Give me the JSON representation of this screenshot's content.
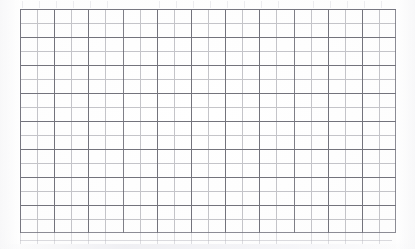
{
  "document": {
    "kind": "graph-paper-grid",
    "description": "Scanned sheet of blank quadrille graph paper",
    "caption": "",
    "has_text": false,
    "has_labels": false
  },
  "canvas": {
    "width": 415,
    "height": 249,
    "background_color": "#ffffff",
    "paper_tone_color": "#fdfdfd"
  },
  "grid": {
    "origin_x": 20,
    "origin_y": 9,
    "width": 376,
    "height": 224,
    "columns": 22,
    "rows": 16,
    "cell_width": 17.1,
    "cell_height": 14.0,
    "major_every_columns": 2,
    "major_every_rows": 2,
    "minor_line_color": "#96969e",
    "major_line_color": "#60606a",
    "border_line_color": "#787882",
    "minor_line_width": 0.8,
    "major_line_width": 1.0,
    "border_line_width": 1.0
  },
  "artifacts": {
    "bottom_bleed_color": "#aaaab4",
    "top_bleed_color": "#c3c3cd",
    "margin_shade_color": "#f4f4f6",
    "bottom_streak_color": "#eeeef2"
  }
}
